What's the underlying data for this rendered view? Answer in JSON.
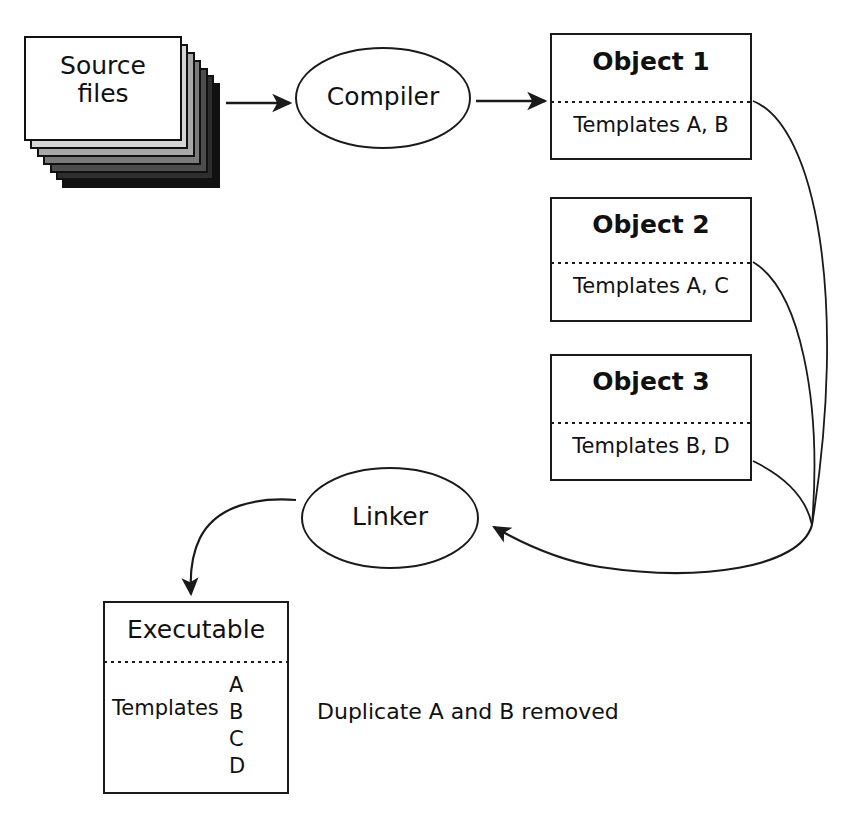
{
  "diagram": {
    "stroke_color": "#1a1a1a",
    "text_color": "#111111",
    "background_color": "#ffffff"
  },
  "source": {
    "label": "Source\nfiles",
    "sheet_count": 7
  },
  "compiler": {
    "label": "Compiler"
  },
  "linker": {
    "label": "Linker"
  },
  "objects": [
    {
      "title": "Object 1",
      "templates": "Templates A, B"
    },
    {
      "title": "Object 2",
      "templates": "Templates A, C"
    },
    {
      "title": "Object 3",
      "templates": "Templates B, D"
    }
  ],
  "executable": {
    "title": "Executable",
    "templates_label": "Templates",
    "template_letters": [
      "A",
      "B",
      "C",
      "D"
    ]
  },
  "note": {
    "text": "Duplicate A and B removed"
  }
}
